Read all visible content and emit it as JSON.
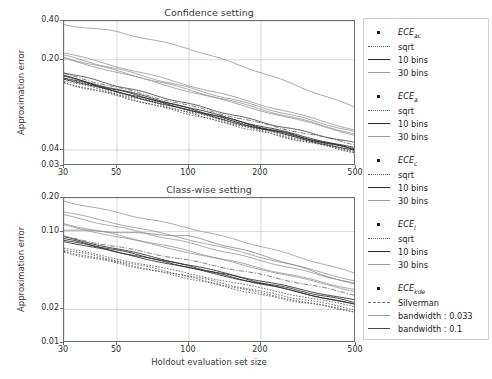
{
  "figure": {
    "width": 492,
    "height": 379,
    "background": "#ffffff"
  },
  "axis_label_x": "Holdout evaluation set size",
  "axis_label_y": "Approximation error",
  "legend": {
    "groups": [
      {
        "header": "ECE",
        "header_sub": "ac",
        "entries": [
          {
            "label": "sqrt",
            "style": "dotted",
            "color": "#5a5a5a"
          },
          {
            "label": "10 bins",
            "style": "solid",
            "color": "#2b2b2b"
          },
          {
            "label": "30 bins",
            "style": "solid",
            "color": "#9a9a9a"
          }
        ]
      },
      {
        "header": "ECE",
        "header_sub": "a",
        "entries": [
          {
            "label": "sqrt",
            "style": "dotted",
            "color": "#5a5a5a"
          },
          {
            "label": "10 bins",
            "style": "solid",
            "color": "#2b2b2b"
          },
          {
            "label": "30 bins",
            "style": "solid",
            "color": "#9a9a9a"
          }
        ]
      },
      {
        "header": "ECE",
        "header_sub": "c",
        "entries": [
          {
            "label": "sqrt",
            "style": "dotted",
            "color": "#5a5a5a"
          },
          {
            "label": "10 bins",
            "style": "solid",
            "color": "#2b2b2b"
          },
          {
            "label": "30 bins",
            "style": "solid",
            "color": "#9a9a9a"
          }
        ]
      },
      {
        "header": "ECE",
        "header_sub": "l",
        "entries": [
          {
            "label": "sqrt",
            "style": "dotted",
            "color": "#5a5a5a"
          },
          {
            "label": "10 bins",
            "style": "solid",
            "color": "#2b2b2b"
          },
          {
            "label": "30 bins",
            "style": "solid",
            "color": "#9a9a9a"
          }
        ]
      },
      {
        "header": "ECE",
        "header_sub": "kde",
        "entries": [
          {
            "label": "Silverman",
            "style": "dashdot",
            "color": "#6a6a6a"
          },
          {
            "label": "bandwidth : 0.033",
            "style": "solid",
            "color": "#9a9a9a"
          },
          {
            "label": "bandwidth : 0.1",
            "style": "solid",
            "color": "#4a4a4a"
          }
        ]
      }
    ]
  },
  "chart_data": [
    {
      "id": "confidence",
      "type": "line",
      "title": "Confidence setting",
      "xlabel": "",
      "ylabel": "Approximation error",
      "xscale": "log",
      "yscale": "log",
      "xlim": [
        30,
        500
      ],
      "ylim": [
        0.03,
        0.4
      ],
      "xticks": [
        30,
        50,
        100,
        200,
        500
      ],
      "xticklabels": [
        "30",
        "50",
        "100",
        "200",
        "500"
      ],
      "yticks": [
        0.03,
        0.04,
        0.2,
        0.4
      ],
      "yticklabels": [
        "0.03",
        "0.04",
        "0.20",
        "0.40"
      ],
      "grid": true,
      "x": [
        30,
        50,
        100,
        200,
        500
      ],
      "series": [
        {
          "name": "ECE_ac sqrt",
          "style": "dotted",
          "color": "#5a5a5a",
          "values": [
            0.142,
            0.112,
            0.081,
            0.059,
            0.04
          ]
        },
        {
          "name": "ECE_ac 10 bins",
          "style": "solid",
          "color": "#2b2b2b",
          "values": [
            0.15,
            0.118,
            0.085,
            0.061,
            0.041
          ]
        },
        {
          "name": "ECE_ac 30 bins",
          "style": "solid",
          "color": "#9a9a9a",
          "values": [
            0.21,
            0.164,
            0.117,
            0.083,
            0.053
          ]
        },
        {
          "name": "ECE_a sqrt",
          "style": "dotted",
          "color": "#5a5a5a",
          "values": [
            0.138,
            0.109,
            0.079,
            0.057,
            0.039
          ]
        },
        {
          "name": "ECE_a 10 bins",
          "style": "solid",
          "color": "#2b2b2b",
          "values": [
            0.148,
            0.116,
            0.084,
            0.06,
            0.04
          ]
        },
        {
          "name": "ECE_a 30 bins",
          "style": "solid",
          "color": "#9a9a9a",
          "values": [
            0.205,
            0.16,
            0.114,
            0.081,
            0.052
          ]
        },
        {
          "name": "ECE_c sqrt",
          "style": "dotted",
          "color": "#5a5a5a",
          "values": [
            0.134,
            0.106,
            0.077,
            0.056,
            0.038
          ]
        },
        {
          "name": "ECE_c 10 bins",
          "style": "solid",
          "color": "#2b2b2b",
          "values": [
            0.145,
            0.114,
            0.082,
            0.059,
            0.04
          ]
        },
        {
          "name": "ECE_c 30 bins",
          "style": "solid",
          "color": "#9a9a9a",
          "values": [
            0.216,
            0.17,
            0.121,
            0.086,
            0.055
          ]
        },
        {
          "name": "ECE_l sqrt",
          "style": "dotted",
          "color": "#5a5a5a",
          "values": [
            0.132,
            0.105,
            0.076,
            0.055,
            0.038
          ]
        },
        {
          "name": "ECE_l 10 bins",
          "style": "solid",
          "color": "#2b2b2b",
          "values": [
            0.143,
            0.112,
            0.081,
            0.058,
            0.039
          ]
        },
        {
          "name": "ECE_l 30 bins",
          "style": "solid",
          "color": "#9a9a9a",
          "values": [
            0.226,
            0.178,
            0.127,
            0.09,
            0.057
          ]
        },
        {
          "name": "ECE_kde Silverman",
          "style": "dashdot",
          "color": "#6a6a6a",
          "values": [
            0.155,
            0.122,
            0.088,
            0.064,
            0.044
          ]
        },
        {
          "name": "ECE_kde bw 0.033",
          "style": "solid",
          "color": "#9a9a9a",
          "values": [
            0.375,
            0.33,
            0.245,
            0.16,
            0.085
          ]
        },
        {
          "name": "ECE_kde bw 0.1",
          "style": "solid",
          "color": "#4a4a4a",
          "values": [
            0.16,
            0.126,
            0.091,
            0.066,
            0.045
          ]
        }
      ]
    },
    {
      "id": "classwise",
      "type": "line",
      "title": "Class-wise setting",
      "xlabel": "Holdout evaluation set size",
      "ylabel": "Approximation error",
      "xscale": "log",
      "yscale": "log",
      "xlim": [
        30,
        500
      ],
      "ylim": [
        0.01,
        0.2
      ],
      "xticks": [
        30,
        50,
        100,
        200,
        500
      ],
      "xticklabels": [
        "30",
        "50",
        "100",
        "200",
        "500"
      ],
      "yticks": [
        0.01,
        0.02,
        0.1,
        0.2
      ],
      "yticklabels": [
        "0.01",
        "0.02",
        "0.10",
        "0.20"
      ],
      "grid": true,
      "x": [
        30,
        50,
        100,
        200,
        500
      ],
      "series": [
        {
          "name": "ECE_ac sqrt",
          "style": "dotted",
          "color": "#5a5a5a",
          "values": [
            0.071,
            0.057,
            0.042,
            0.031,
            0.021
          ]
        },
        {
          "name": "ECE_ac 10 bins",
          "style": "solid",
          "color": "#2b2b2b",
          "values": [
            0.089,
            0.07,
            0.05,
            0.036,
            0.024
          ]
        },
        {
          "name": "ECE_ac 30 bins",
          "style": "solid",
          "color": "#9a9a9a",
          "values": [
            0.118,
            0.093,
            0.067,
            0.047,
            0.03
          ]
        },
        {
          "name": "ECE_a sqrt",
          "style": "dotted",
          "color": "#5a5a5a",
          "values": [
            0.069,
            0.055,
            0.04,
            0.029,
            0.02
          ]
        },
        {
          "name": "ECE_a 10 bins",
          "style": "solid",
          "color": "#2b2b2b",
          "values": [
            0.086,
            0.068,
            0.049,
            0.035,
            0.023
          ]
        },
        {
          "name": "ECE_a 30 bins",
          "style": "solid",
          "color": "#9a9a9a",
          "values": [
            0.114,
            0.09,
            0.065,
            0.046,
            0.029
          ]
        },
        {
          "name": "ECE_c sqrt",
          "style": "dotted",
          "color": "#5a5a5a",
          "values": [
            0.067,
            0.053,
            0.039,
            0.028,
            0.019
          ]
        },
        {
          "name": "ECE_c 10 bins",
          "style": "solid",
          "color": "#2b2b2b",
          "values": [
            0.084,
            0.066,
            0.048,
            0.034,
            0.022
          ]
        },
        {
          "name": "ECE_c 30 bins",
          "style": "solid",
          "color": "#9a9a9a",
          "values": [
            0.14,
            0.11,
            0.079,
            0.055,
            0.034
          ]
        },
        {
          "name": "ECE_l sqrt",
          "style": "dotted",
          "color": "#5a5a5a",
          "values": [
            0.065,
            0.052,
            0.038,
            0.027,
            0.019
          ]
        },
        {
          "name": "ECE_l 10 bins",
          "style": "solid",
          "color": "#2b2b2b",
          "values": [
            0.082,
            0.065,
            0.047,
            0.034,
            0.022
          ]
        },
        {
          "name": "ECE_l 30 bins",
          "style": "solid",
          "color": "#9a9a9a",
          "values": [
            0.15,
            0.118,
            0.085,
            0.059,
            0.036
          ]
        },
        {
          "name": "ECE_kde Silverman",
          "style": "dashdot",
          "color": "#6a6a6a",
          "values": [
            0.09,
            0.073,
            0.055,
            0.041,
            0.027
          ]
        },
        {
          "name": "ECE_kde bw 0.033",
          "style": "solid",
          "color": "#9a9a9a",
          "values": [
            0.188,
            0.148,
            0.108,
            0.074,
            0.042
          ]
        },
        {
          "name": "ECE_kde bw 0.1",
          "style": "solid",
          "color": "#8a8a8a",
          "values": [
            0.104,
            0.099,
            0.091,
            0.062,
            0.033
          ]
        }
      ]
    }
  ]
}
